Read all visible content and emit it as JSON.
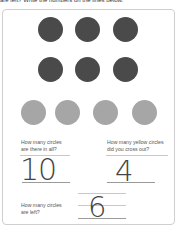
{
  "instructions": "are left? Write the numbers on the lines below.",
  "circles": {
    "row1": {
      "count": 3,
      "color": "#4a4a4a",
      "type": "dark"
    },
    "row2": {
      "count": 3,
      "color": "#4a4a4a",
      "type": "dark"
    },
    "row3": {
      "count": 4,
      "color": "#a6a6a6",
      "type": "yellow (shown gray)"
    }
  },
  "questions": [
    {
      "line1": "How many circles",
      "line2": "are there in all?",
      "answer": "10"
    },
    {
      "line1": "How many yellow circles",
      "line2": "did you cross out?",
      "answer": "4"
    },
    {
      "line1": "How many circles",
      "line2": "are left?",
      "answer": "6"
    }
  ]
}
